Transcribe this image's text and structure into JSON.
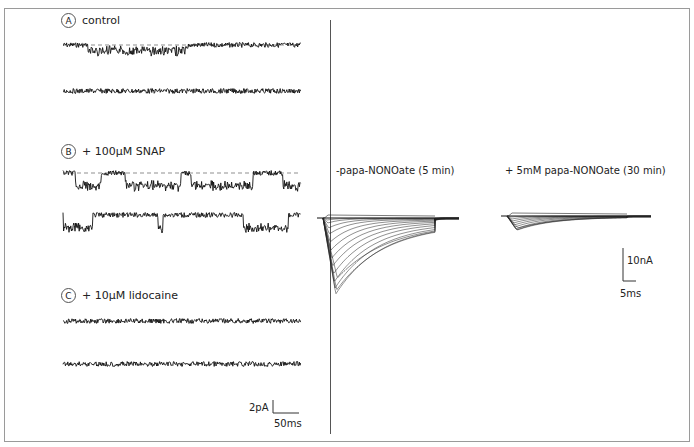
{
  "figure": {
    "left_panels": [
      {
        "letter": "A",
        "label": "control"
      },
      {
        "letter": "B",
        "label": "+ 100µM SNAP"
      },
      {
        "letter": "C",
        "label": "+ 10µM lidocaine"
      }
    ],
    "left_scale": {
      "y_label": "2pA",
      "x_label": "50ms"
    },
    "right_panels": [
      {
        "label": "-papa-NONOate (5 min)"
      },
      {
        "label": "+ 5mM papa-NONOate (30 min)"
      }
    ],
    "right_scale": {
      "y_label": "10nA",
      "x_label": "5ms"
    }
  },
  "chart_data": [
    {
      "type": "line",
      "title": "A control",
      "description": "single-channel current recordings, 2 sweeps, brief openings in sweep 1",
      "scale": {
        "current": "2pA",
        "time": "50ms"
      }
    },
    {
      "type": "line",
      "title": "B + 100µM SNAP",
      "description": "single-channel recordings, 2 sweeps, frequent long openings",
      "scale": {
        "current": "2pA",
        "time": "50ms"
      }
    },
    {
      "type": "line",
      "title": "C + 10µM lidocaine",
      "description": "single-channel recordings, 2 sweeps, no openings",
      "scale": {
        "current": "2pA",
        "time": "50ms"
      }
    },
    {
      "type": "line",
      "title": "-papa-NONOate (5 min)",
      "description": "family of whole-cell Na+ current traces, large inward peaks",
      "scale": {
        "current": "10nA",
        "time": "5ms"
      }
    },
    {
      "type": "line",
      "title": "+ 5mM papa-NONOate (30 min)",
      "description": "family of whole-cell current traces, strongly reduced peaks",
      "scale": {
        "current": "10nA",
        "time": "5ms"
      }
    }
  ]
}
